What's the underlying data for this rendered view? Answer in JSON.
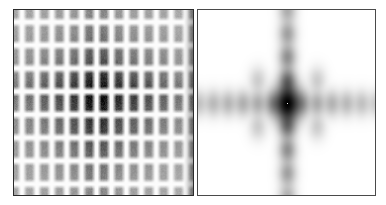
{
  "figure": {
    "title": "",
    "background_color": "#ffffff",
    "width": 386,
    "height": 205
  },
  "panels": [
    {
      "id": "real-space",
      "name": "Real-space periodic lattice image",
      "position": "left",
      "x": 13,
      "y": 9,
      "width": 181,
      "height": 187,
      "background_color": "#000000",
      "border_color": "#2b2b2b",
      "colormap": "grayscale-inverted",
      "description": "Two-dimensional periodic array of dark blobs separated by bright white grid lines, with an enhanced dark central row and central column forming a cross"
    },
    {
      "id": "reciprocal-space",
      "name": "Fourier transform / diffraction pattern",
      "position": "right",
      "x": 197,
      "y": 9,
      "width": 179,
      "height": 187,
      "background_color": "#ffffff",
      "border_color": "#4a4a4a",
      "colormap": "grayscale",
      "description": "Cross-shaped array of diffraction spots on a white field with a very intense central zero-order spot containing a single bright pixel at its core"
    }
  ],
  "chart_data": {
    "type": "heatmap",
    "title": "",
    "subtitle": "",
    "xlabel": "",
    "ylabel": "",
    "legend": [],
    "grid": false,
    "panels": [
      {
        "name": "real-space-lattice",
        "type": "heatmap",
        "colormap": "gray",
        "value_range": [
          0,
          1
        ],
        "lattice": {
          "columns": 12,
          "rows": 8,
          "cell_width_px": 15.1,
          "cell_height_px": 23.4,
          "gridline_color": "#ffffff",
          "gridline_width_px": 2.2,
          "blob_color": "#000000",
          "blob_softness_px": 4.0,
          "center_column_index": 5,
          "center_row_index": 3,
          "center_enhancement": 1.0,
          "envelope_sigma_x_px": 52,
          "envelope_sigma_y_px": 44
        },
        "column_amplitudes": [
          0.55,
          0.58,
          0.6,
          0.64,
          0.72,
          1.0,
          0.7,
          0.62,
          0.58,
          0.55,
          0.52,
          0.48
        ],
        "row_amplitudes": [
          0.58,
          0.62,
          0.7,
          1.0,
          0.72,
          0.64,
          0.6,
          0.55
        ]
      },
      {
        "name": "fourier-transform",
        "type": "heatmap",
        "colormap": "gray_r",
        "value_range": [
          0,
          1
        ],
        "center_x_px": 90,
        "center_y_px": 94,
        "spot_spacing_x_px": 15.0,
        "spot_spacing_y_px": 23.5,
        "spot_sigma_x_px": 5.0,
        "spot_sigma_y_px": 7.5,
        "central_spot_intensity": 1.0,
        "central_white_pixel": true,
        "horizontal_orders": [
          -6,
          -5,
          -4,
          -3,
          -2,
          -1,
          0,
          1,
          2,
          3,
          4,
          5,
          6
        ],
        "horizontal_intensities": [
          0.1,
          0.12,
          0.13,
          0.15,
          0.16,
          0.22,
          1.0,
          0.2,
          0.16,
          0.14,
          0.12,
          0.1,
          0.08
        ],
        "vertical_orders": [
          -4,
          -3,
          -2,
          -1,
          0,
          1,
          2,
          3,
          4
        ],
        "vertical_intensities": [
          0.16,
          0.2,
          0.26,
          0.36,
          1.0,
          0.34,
          0.26,
          0.2,
          0.15
        ],
        "satellite_orders": [
          [
            -2,
            1
          ],
          [
            2,
            1
          ],
          [
            -2,
            -1
          ],
          [
            2,
            -1
          ]
        ],
        "satellite_intensity": 0.07
      }
    ]
  }
}
